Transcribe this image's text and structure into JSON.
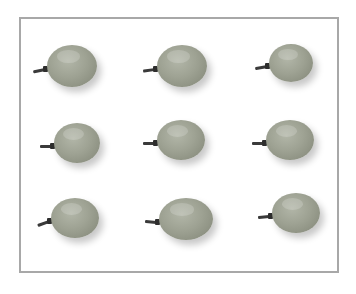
{
  "image": {
    "description": "Nine green grapes arranged in a 3x3 grid inside a gray rectangular frame",
    "frame_color": "#a8a8a8",
    "grape_color": "#9ea293",
    "grapes": [
      {
        "row": 1,
        "col": 1,
        "cx": 72,
        "cy": 66,
        "rx": 25,
        "ry": 21,
        "stem_angle": -12
      },
      {
        "row": 1,
        "col": 2,
        "cx": 182,
        "cy": 66,
        "rx": 25,
        "ry": 21,
        "stem_angle": -8
      },
      {
        "row": 1,
        "col": 3,
        "cx": 291,
        "cy": 63,
        "rx": 22,
        "ry": 19,
        "stem_angle": -10
      },
      {
        "row": 2,
        "col": 1,
        "cx": 77,
        "cy": 143,
        "rx": 23,
        "ry": 20,
        "stem_angle": 0
      },
      {
        "row": 2,
        "col": 2,
        "cx": 181,
        "cy": 140,
        "rx": 24,
        "ry": 20,
        "stem_angle": 0
      },
      {
        "row": 2,
        "col": 3,
        "cx": 290,
        "cy": 140,
        "rx": 24,
        "ry": 20,
        "stem_angle": 0
      },
      {
        "row": 3,
        "col": 1,
        "cx": 75,
        "cy": 218,
        "rx": 24,
        "ry": 20,
        "stem_angle": -20
      },
      {
        "row": 3,
        "col": 2,
        "cx": 186,
        "cy": 219,
        "rx": 27,
        "ry": 21,
        "stem_angle": 5
      },
      {
        "row": 3,
        "col": 3,
        "cx": 296,
        "cy": 213,
        "rx": 24,
        "ry": 20,
        "stem_angle": -5
      }
    ]
  }
}
